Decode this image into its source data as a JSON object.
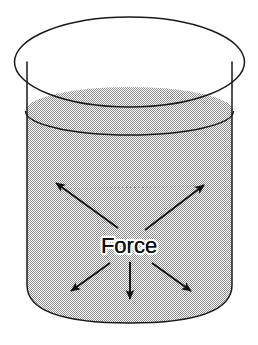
{
  "figure": {
    "caption_label": "Force",
    "background_color": "#ffffff",
    "line_color": "#1a1a1a",
    "fill_pattern": "stipple-checker-50",
    "fill_color": "#8c8c8c",
    "stroke_width": 1.4
  },
  "container": {
    "type": "cylinder",
    "rim_ellipse": {
      "cx": 129.5,
      "cy": 62,
      "rx": 115,
      "ry": 45
    },
    "wall_left_x": 27,
    "wall_right_x": 232,
    "wall_top_y": 62,
    "base_y": 285,
    "base_curve_depth": 38
  },
  "liquid": {
    "surface_ellipse": {
      "cx": 129.5,
      "cy": 111,
      "rx": 104,
      "ry": 24
    },
    "surface_label": "liquid surface"
  },
  "guide_line": {
    "x1": 60,
    "y1": 190,
    "x2": 200,
    "y2": 187,
    "style": "dotted"
  },
  "arrows": [
    {
      "name": "arrow-up-left",
      "direction": "up-left",
      "x1": 118,
      "y1": 228,
      "x2": 55,
      "y2": 182
    },
    {
      "name": "arrow-up-right",
      "direction": "up-right",
      "x1": 145,
      "y1": 230,
      "x2": 205,
      "y2": 184
    },
    {
      "name": "arrow-down-left",
      "direction": "down-left",
      "x1": 110,
      "y1": 262,
      "x2": 70,
      "y2": 292
    },
    {
      "name": "arrow-down-center",
      "direction": "down",
      "x1": 130,
      "y1": 262,
      "x2": 130,
      "y2": 300
    },
    {
      "name": "arrow-down-right",
      "direction": "down-right",
      "x1": 152,
      "y1": 262,
      "x2": 192,
      "y2": 292
    }
  ],
  "caption": {
    "text": "Force",
    "x": 129,
    "y": 253,
    "font_size": 22
  }
}
